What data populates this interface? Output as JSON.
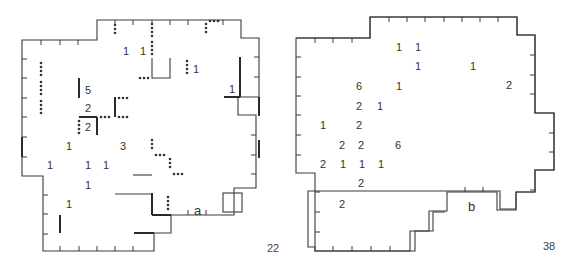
{
  "figure": {
    "panels": [
      {
        "label": "a",
        "page_number": "22",
        "counts": [
          {
            "v": "1",
            "x": 123,
            "y": 51
          },
          {
            "v": "1",
            "x": 141,
            "y": 51
          },
          {
            "v": "1",
            "x": 196,
            "y": 70
          },
          {
            "v": "5",
            "x": 88,
            "y": 92
          },
          {
            "v": "1",
            "x": 230,
            "y": 92
          },
          {
            "v": "2",
            "x": 88,
            "y": 111
          },
          {
            "v": "2",
            "x": 88,
            "y": 130
          },
          {
            "v": "1",
            "x": 68,
            "y": 149
          },
          {
            "v": "3",
            "x": 123,
            "y": 149
          },
          {
            "v": "1",
            "x": 50,
            "y": 168
          },
          {
            "v": "1",
            "x": 88,
            "y": 168
          },
          {
            "v": "1",
            "x": 106,
            "y": 168
          },
          {
            "v": "1",
            "x": 88,
            "y": 188
          },
          {
            "v": "1",
            "x": 68,
            "y": 208
          }
        ]
      },
      {
        "label": "b",
        "page_number": "38",
        "counts": [
          {
            "v": "1",
            "x": 398,
            "y": 51
          },
          {
            "v": "1",
            "x": 417,
            "y": 51
          },
          {
            "v": "1",
            "x": 417,
            "y": 70
          },
          {
            "v": "1",
            "x": 472,
            "y": 70
          },
          {
            "v": "6",
            "x": 359,
            "y": 90
          },
          {
            "v": "1",
            "x": 398,
            "y": 90
          },
          {
            "v": "2",
            "x": 509,
            "y": 88
          },
          {
            "v": "2",
            "x": 359,
            "y": 111
          },
          {
            "v": "1",
            "x": 380,
            "y": 111
          },
          {
            "v": "1",
            "x": 323,
            "y": 130
          },
          {
            "v": "2",
            "x": 359,
            "y": 130
          },
          {
            "v": "2",
            "x": 342,
            "y": 149
          },
          {
            "v": "2",
            "x": 361,
            "y": 149
          },
          {
            "v": "6",
            "x": 398,
            "y": 149
          },
          {
            "v": "2",
            "x": 323,
            "y": 168
          },
          {
            "v": "1",
            "x": 342,
            "y": 168
          },
          {
            "v": "1",
            "x": 361,
            "y": 168
          },
          {
            "v": "1",
            "x": 380,
            "y": 168
          },
          {
            "v": "2",
            "x": 361,
            "y": 187
          },
          {
            "v": "2",
            "x": 342,
            "y": 208
          }
        ]
      }
    ]
  }
}
